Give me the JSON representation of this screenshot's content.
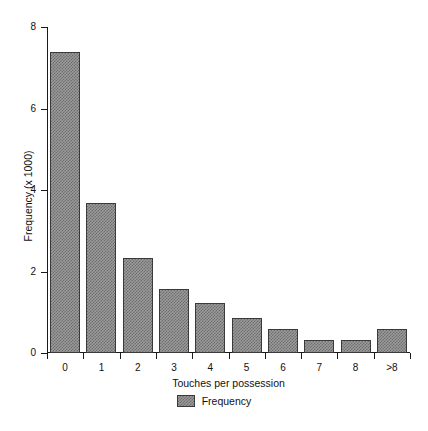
{
  "chart_data": {
    "type": "bar",
    "title": "",
    "subtitle": "",
    "xlabel": "Touches per possession",
    "ylabel": "Frequency (x 1000)",
    "categories": [
      "0",
      "1",
      "2",
      "3",
      "4",
      "5",
      "6",
      "7",
      "8",
      ">8"
    ],
    "values": [
      7.39,
      3.67,
      2.34,
      1.58,
      1.23,
      0.86,
      0.59,
      0.32,
      0.32,
      0.59
    ],
    "series": [
      {
        "name": "Frequency",
        "values": [
          7.39,
          3.67,
          2.34,
          1.58,
          1.23,
          0.86,
          0.59,
          0.32,
          0.32,
          0.59
        ]
      }
    ],
    "ylim": [
      0,
      8
    ],
    "yticks": [
      0,
      2,
      4,
      6,
      8
    ],
    "ytick_labels": [
      "0",
      "2",
      "4",
      "6",
      "8"
    ],
    "grid": false,
    "legend_position": "bottom",
    "legend_entries": [
      "Frequency"
    ],
    "bar_fill_color": "#9a9a9a",
    "bar_border_color": "#3a3a3a",
    "axis_color": "#1a1a1a",
    "background_color": "#ffffff"
  },
  "legend": {
    "label": "Frequency"
  }
}
